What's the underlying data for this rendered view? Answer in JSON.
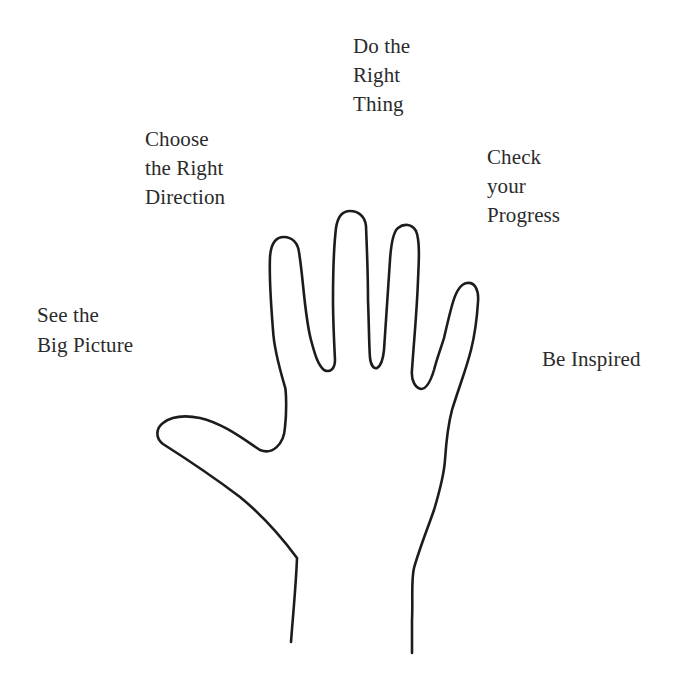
{
  "diagram": {
    "type": "hand-metaphor",
    "colors": {
      "background": "#ffffff",
      "outline": "#1c1c1c",
      "text": "#2b2b2b"
    },
    "labels": [
      {
        "id": "thumb",
        "points_to": "thumb",
        "lines": [
          "See the",
          "Big Picture"
        ]
      },
      {
        "id": "index",
        "points_to": "index-finger",
        "lines": [
          "Choose",
          "the Right",
          "Direction"
        ]
      },
      {
        "id": "middle",
        "points_to": "middle-finger",
        "lines": [
          "Do the",
          "Right",
          "Thing"
        ]
      },
      {
        "id": "ring",
        "points_to": "ring-finger",
        "lines": [
          "Check",
          "your",
          "Progress"
        ]
      },
      {
        "id": "pinky",
        "points_to": "little-finger",
        "lines": [
          "Be Inspired"
        ]
      }
    ]
  }
}
